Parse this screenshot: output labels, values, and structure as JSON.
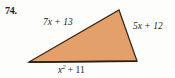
{
  "problem": {
    "number": "74."
  },
  "figure": {
    "shape_name": "triangle",
    "fill_color": "#e3a06a",
    "stroke_color": "#3a2a18",
    "background_color": "#fdfdfc",
    "vertices": {
      "left": [
        29,
        62
      ],
      "apex": [
        119,
        10
      ],
      "right": [
        137,
        61
      ]
    }
  },
  "labels": {
    "top_left_side": {
      "full": "7x + 13",
      "coefficient": "7",
      "variable": "x",
      "operator": "+",
      "constant": "13"
    },
    "right_side": {
      "full": "5x + 12",
      "coefficient": "5",
      "variable": "x",
      "operator": "+",
      "constant": "12"
    },
    "bottom_side": {
      "full": "x^2 + 11",
      "variable": "x",
      "exponent": "2",
      "operator": "+",
      "constant": "11"
    }
  }
}
